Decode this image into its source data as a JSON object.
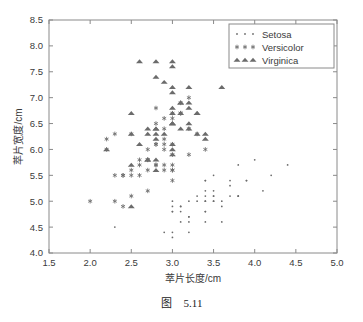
{
  "caption": {
    "prefix": "图",
    "number": "5.11"
  },
  "chart_data": {
    "type": "scatter",
    "title": "",
    "xlabel": "萃片长度/cm",
    "ylabel": "萃片宽度/cm",
    "xlim": [
      1.5,
      5.0
    ],
    "ylim": [
      4.0,
      8.5
    ],
    "xticks": [
      "1.5",
      "2.0",
      "2.5",
      "3.0",
      "3.5",
      "4.0",
      "4.5",
      "5.0"
    ],
    "yticks": [
      "4.0",
      "4.5",
      "5.0",
      "5.5",
      "6.0",
      "6.5",
      "7.0",
      "7.5",
      "8.0",
      "8.5"
    ],
    "xtick_values": [
      1.5,
      2.0,
      2.5,
      3.0,
      3.5,
      4.0,
      4.5,
      5.0
    ],
    "ytick_values": [
      4.0,
      4.5,
      5.0,
      5.5,
      6.0,
      6.5,
      7.0,
      7.5,
      8.0,
      8.5
    ],
    "grid": false,
    "legend_position": "top-right",
    "marker_color": "#6b6b6b",
    "axis_color": "#8a8a8a",
    "text_color": "#3a3a3a",
    "series": [
      {
        "name": "Setosa",
        "marker": "dot",
        "points": [
          [
            3.5,
            5.1
          ],
          [
            3.0,
            4.9
          ],
          [
            3.2,
            4.7
          ],
          [
            3.1,
            4.6
          ],
          [
            3.6,
            5.0
          ],
          [
            3.9,
            5.4
          ],
          [
            3.4,
            4.6
          ],
          [
            3.4,
            5.0
          ],
          [
            2.9,
            4.4
          ],
          [
            3.1,
            4.9
          ],
          [
            3.7,
            5.4
          ],
          [
            3.4,
            4.8
          ],
          [
            3.0,
            4.8
          ],
          [
            3.0,
            4.3
          ],
          [
            4.0,
            5.8
          ],
          [
            4.4,
            5.7
          ],
          [
            3.9,
            5.4
          ],
          [
            3.5,
            5.1
          ],
          [
            3.8,
            5.7
          ],
          [
            3.8,
            5.1
          ],
          [
            3.4,
            5.4
          ],
          [
            3.7,
            5.1
          ],
          [
            3.6,
            4.6
          ],
          [
            3.3,
            5.1
          ],
          [
            3.4,
            4.8
          ],
          [
            3.0,
            5.0
          ],
          [
            3.4,
            5.0
          ],
          [
            3.5,
            5.2
          ],
          [
            3.4,
            5.2
          ],
          [
            3.2,
            4.7
          ],
          [
            3.1,
            4.8
          ],
          [
            3.4,
            5.4
          ],
          [
            4.1,
            5.2
          ],
          [
            4.2,
            5.5
          ],
          [
            3.1,
            4.9
          ],
          [
            3.2,
            5.0
          ],
          [
            3.5,
            5.5
          ],
          [
            3.6,
            4.9
          ],
          [
            3.0,
            4.4
          ],
          [
            3.4,
            5.1
          ],
          [
            3.5,
            5.0
          ],
          [
            2.3,
            4.5
          ],
          [
            3.2,
            4.4
          ],
          [
            3.5,
            5.0
          ],
          [
            3.8,
            5.1
          ],
          [
            3.0,
            4.8
          ],
          [
            3.8,
            5.1
          ],
          [
            3.2,
            4.6
          ],
          [
            3.7,
            5.3
          ],
          [
            3.3,
            5.0
          ]
        ]
      },
      {
        "name": "Versicolor",
        "marker": "star",
        "points": [
          [
            3.2,
            7.0
          ],
          [
            3.2,
            6.4
          ],
          [
            3.1,
            6.9
          ],
          [
            2.3,
            5.5
          ],
          [
            2.8,
            6.5
          ],
          [
            2.8,
            5.7
          ],
          [
            3.3,
            6.3
          ],
          [
            2.4,
            4.9
          ],
          [
            2.9,
            6.6
          ],
          [
            2.7,
            5.2
          ],
          [
            2.0,
            5.0
          ],
          [
            3.0,
            5.9
          ],
          [
            2.2,
            6.0
          ],
          [
            2.9,
            6.1
          ],
          [
            2.9,
            5.6
          ],
          [
            3.1,
            6.7
          ],
          [
            3.0,
            5.6
          ],
          [
            2.7,
            5.8
          ],
          [
            2.2,
            6.2
          ],
          [
            2.5,
            5.6
          ],
          [
            3.2,
            5.9
          ],
          [
            2.8,
            6.1
          ],
          [
            2.5,
            6.3
          ],
          [
            2.8,
            6.1
          ],
          [
            2.9,
            6.4
          ],
          [
            3.0,
            6.6
          ],
          [
            2.8,
            6.8
          ],
          [
            3.0,
            6.7
          ],
          [
            2.9,
            6.0
          ],
          [
            2.6,
            5.7
          ],
          [
            2.4,
            5.5
          ],
          [
            2.4,
            5.5
          ],
          [
            2.7,
            5.8
          ],
          [
            2.7,
            6.0
          ],
          [
            3.0,
            5.4
          ],
          [
            3.4,
            6.0
          ],
          [
            3.1,
            6.7
          ],
          [
            2.3,
            6.3
          ],
          [
            3.0,
            5.6
          ],
          [
            2.5,
            5.5
          ],
          [
            2.6,
            5.5
          ],
          [
            3.0,
            6.1
          ],
          [
            2.6,
            5.8
          ],
          [
            2.3,
            5.0
          ],
          [
            2.7,
            5.6
          ],
          [
            3.0,
            5.7
          ],
          [
            2.9,
            5.7
          ],
          [
            2.9,
            6.2
          ],
          [
            2.5,
            5.1
          ],
          [
            2.8,
            5.7
          ]
        ]
      },
      {
        "name": "Virginica",
        "marker": "triangle",
        "points": [
          [
            3.3,
            6.3
          ],
          [
            2.7,
            5.8
          ],
          [
            3.0,
            7.1
          ],
          [
            2.9,
            6.3
          ],
          [
            3.0,
            6.5
          ],
          [
            3.0,
            7.6
          ],
          [
            2.5,
            4.9
          ],
          [
            2.9,
            7.3
          ],
          [
            2.5,
            6.7
          ],
          [
            3.6,
            7.2
          ],
          [
            3.2,
            6.5
          ],
          [
            2.7,
            6.4
          ],
          [
            3.0,
            6.8
          ],
          [
            2.5,
            5.7
          ],
          [
            2.8,
            5.8
          ],
          [
            3.2,
            6.4
          ],
          [
            3.0,
            6.5
          ],
          [
            3.8,
            7.7
          ],
          [
            2.6,
            7.7
          ],
          [
            2.2,
            6.0
          ],
          [
            3.2,
            6.9
          ],
          [
            2.8,
            5.6
          ],
          [
            2.8,
            7.7
          ],
          [
            2.7,
            6.3
          ],
          [
            3.3,
            6.7
          ],
          [
            3.2,
            7.2
          ],
          [
            2.8,
            6.2
          ],
          [
            3.0,
            6.1
          ],
          [
            2.8,
            6.4
          ],
          [
            3.0,
            7.2
          ],
          [
            2.8,
            7.4
          ],
          [
            3.8,
            7.9
          ],
          [
            2.8,
            6.4
          ],
          [
            2.8,
            6.3
          ],
          [
            2.6,
            6.1
          ],
          [
            3.0,
            7.7
          ],
          [
            3.4,
            6.3
          ],
          [
            3.1,
            6.4
          ],
          [
            3.0,
            6.0
          ],
          [
            3.1,
            6.9
          ],
          [
            3.1,
            6.7
          ],
          [
            3.1,
            6.9
          ],
          [
            2.7,
            5.8
          ],
          [
            3.2,
            6.8
          ],
          [
            3.3,
            6.7
          ],
          [
            3.0,
            6.7
          ],
          [
            2.5,
            6.3
          ],
          [
            3.0,
            6.5
          ],
          [
            3.4,
            6.2
          ],
          [
            3.0,
            5.9
          ]
        ]
      }
    ]
  }
}
